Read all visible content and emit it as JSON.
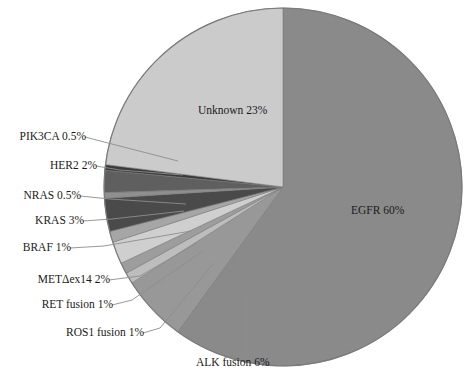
{
  "chart_data": {
    "type": "pie",
    "title": "",
    "subtitle": "",
    "xlabel": "",
    "ylabel": "",
    "grid": false,
    "legend_position": "none",
    "units": "percent",
    "start_angle_deg": 0,
    "direction": "clockwise",
    "center_px": {
      "x": 283,
      "y": 187
    },
    "radius_px": 179,
    "categories": [
      "EGFR",
      "ALK fusion",
      "ROS1 fusion",
      "RET fusion",
      "METΔex14",
      "BRAF",
      "KRAS",
      "NRAS",
      "HER2",
      "PIK3CA",
      "Unknown"
    ],
    "values": [
      60,
      6,
      1,
      1,
      2,
      1,
      3,
      0.5,
      2,
      0.5,
      23
    ],
    "slices": [
      {
        "name": "EGFR",
        "value": 60,
        "label": "EGFR 60%",
        "color": "#8a8a8a",
        "label_placement": "inside"
      },
      {
        "name": "ALK fusion",
        "value": 6,
        "label": "ALK fusion 6%",
        "color": "#989898",
        "label_placement": "callout"
      },
      {
        "name": "ROS1 fusion",
        "value": 1,
        "label": "ROS1 fusion 1%",
        "color": "#bdbdbd",
        "label_placement": "callout"
      },
      {
        "name": "RET fusion",
        "value": 1,
        "label": "RET fusion 1%",
        "color": "#9d9d9d",
        "label_placement": "callout"
      },
      {
        "name": "METΔex14",
        "value": 2,
        "label": "METΔex14 2%",
        "color": "#cfcfcf",
        "label_placement": "callout"
      },
      {
        "name": "BRAF",
        "value": 1,
        "label": "BRAF 1%",
        "color": "#a6a6a6",
        "label_placement": "callout"
      },
      {
        "name": "KRAS",
        "value": 3,
        "label": "KRAS 3%",
        "color": "#4a4a4a",
        "label_placement": "callout"
      },
      {
        "name": "NRAS",
        "value": 0.5,
        "label": "NRAS 0.5%",
        "color": "#8f8f8f",
        "label_placement": "callout"
      },
      {
        "name": "HER2",
        "value": 2,
        "label": "HER2 2%",
        "color": "#5f5f5f",
        "label_placement": "callout"
      },
      {
        "name": "PIK3CA",
        "value": 0.5,
        "label": "PIK3CA 0.5%",
        "color": "#3a3a3a",
        "label_placement": "callout"
      },
      {
        "name": "Unknown",
        "value": 23,
        "label": "Unknown 23%",
        "color": "#cbcbcb",
        "label_placement": "inside"
      }
    ]
  },
  "labels": {
    "egfr": "EGFR 60%",
    "unknown": "Unknown 23%",
    "pik3ca": "PIK3CA 0.5%",
    "her2": "HER2 2%",
    "nras": "NRAS 0.5%",
    "kras": "KRAS 3%",
    "braf": "BRAF 1%",
    "met": "METΔex14 2%",
    "ret": "RET fusion 1%",
    "ros1": "ROS1 fusion 1%",
    "alk": "ALK fusion 6%"
  },
  "colors": {
    "background": "#ffffff",
    "text": "#1a1a1a",
    "leader_line": "#8d8d8d",
    "slice_outline": "#7a7a7a"
  }
}
